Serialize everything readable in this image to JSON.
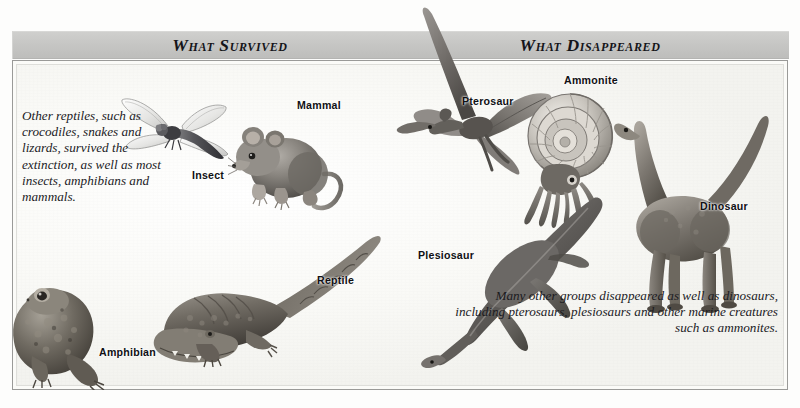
{
  "page": {
    "background_color": "#fdfdfc",
    "frame_border_color": "#9a9a98"
  },
  "header": {
    "band_color": "#c6c6c4",
    "left_title": "What Survived",
    "right_title": "What Disappeared"
  },
  "captions": {
    "left": "Other reptiles, such as crocodiles, snakes and lizards, survived the extinction, as well as most insects, amphibians and mammals.",
    "right": "Many other groups disappeared as well as dinosaurs, including pterosaurs, plesiosaurs and other marine creatures such as ammonites."
  },
  "labels": {
    "insect": "Insect",
    "mammal": "Mammal",
    "reptile": "Reptile",
    "amphibian": "Amphibian",
    "pterosaur": "Pterosaur",
    "ammonite": "Ammonite",
    "plesiosaur": "Plesiosaur",
    "dinosaur": "Dinosaur"
  },
  "illustrations": [
    {
      "name": "dragonfly",
      "group": "survived",
      "label": "Insect"
    },
    {
      "name": "mouse",
      "group": "survived",
      "label": "Mammal"
    },
    {
      "name": "crocodile",
      "group": "survived",
      "label": "Reptile"
    },
    {
      "name": "frog",
      "group": "survived",
      "label": "Amphibian"
    },
    {
      "name": "pterosaur",
      "group": "disappeared",
      "label": "Pterosaur"
    },
    {
      "name": "ammonite",
      "group": "disappeared",
      "label": "Ammonite"
    },
    {
      "name": "plesiosaur",
      "group": "disappeared",
      "label": "Plesiosaur"
    },
    {
      "name": "sauropod",
      "group": "disappeared",
      "label": "Dinosaur"
    }
  ]
}
